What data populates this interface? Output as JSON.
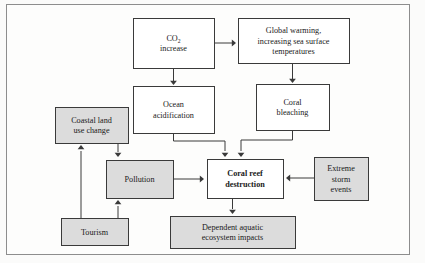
{
  "diagram": {
    "type": "flowchart",
    "frame": {
      "visible": true,
      "border_color": "#8d8d8d"
    },
    "colors": {
      "box_fill_white": "#ffffff",
      "box_fill_gray": "#dcdcdc",
      "box_stroke": "#3a3a3a",
      "text": "#1a1a1a",
      "arrow": "#3a3a3a"
    },
    "nodes": [
      {
        "id": "co2",
        "lines": [
          "CO",
          "increase"
        ],
        "subscript": "2",
        "style": "white",
        "bold": false,
        "x": 133,
        "y": 18,
        "w": 81,
        "h": 50
      },
      {
        "id": "global-warming",
        "lines": [
          "Global warming,",
          "increasing sea surface",
          "temperatures"
        ],
        "style": "white",
        "bold": false,
        "x": 238,
        "y": 18,
        "w": 111,
        "h": 45
      },
      {
        "id": "ocean-acidification",
        "lines": [
          "Ocean",
          "acidification"
        ],
        "style": "white",
        "bold": false,
        "x": 133,
        "y": 86,
        "w": 81,
        "h": 47
      },
      {
        "id": "coral-bleaching",
        "lines": [
          "Coral",
          "bleaching"
        ],
        "style": "white",
        "bold": false,
        "x": 256,
        "y": 84,
        "w": 73,
        "h": 46
      },
      {
        "id": "coastal-land-use",
        "lines": [
          "Coastal land",
          "use change"
        ],
        "style": "gray",
        "bold": false,
        "x": 55,
        "y": 107,
        "w": 73,
        "h": 36
      },
      {
        "id": "pollution",
        "lines": [
          "Pollution"
        ],
        "style": "gray",
        "bold": false,
        "x": 106,
        "y": 160,
        "w": 67,
        "h": 38
      },
      {
        "id": "coral-reef-destruction",
        "lines": [
          "Coral reef",
          "destruction"
        ],
        "style": "white",
        "bold": true,
        "x": 207,
        "y": 159,
        "w": 76,
        "h": 39
      },
      {
        "id": "extreme-storm-events",
        "lines": [
          "Extreme",
          "storm",
          "events"
        ],
        "style": "gray",
        "bold": false,
        "x": 314,
        "y": 157,
        "w": 54,
        "h": 43
      },
      {
        "id": "tourism",
        "lines": [
          "Tourism"
        ],
        "style": "gray",
        "bold": false,
        "x": 61,
        "y": 218,
        "w": 67,
        "h": 27
      },
      {
        "id": "dependent-aquatic",
        "lines": [
          "Dependent aquatic",
          "ecosystem impacts"
        ],
        "style": "gray",
        "bold": false,
        "x": 170,
        "y": 216,
        "w": 125,
        "h": 32
      }
    ],
    "edges": [
      {
        "id": "co2-to-global-warming",
        "from": "co2",
        "to": "global-warming",
        "path": "M214,43 L233,43",
        "arrow_at": [
          236,
          43
        ],
        "arrow_dir": "right"
      },
      {
        "id": "co2-to-ocean-acidification",
        "from": "co2",
        "to": "ocean-acidification",
        "path": "M173.5,68 L173.5,81",
        "arrow_at": [
          173.5,
          85
        ],
        "arrow_dir": "down"
      },
      {
        "id": "global-warming-to-coral-bleaching",
        "from": "global-warming",
        "to": "coral-bleaching",
        "path": "M292.5,63 L292.5,79",
        "arrow_at": [
          292.5,
          83
        ],
        "arrow_dir": "down"
      },
      {
        "id": "ocean-acidification-to-coral-reef",
        "from": "ocean-acidification",
        "to": "coral-reef-destruction",
        "path": "M173.5,133 L173.5,141 L225,141 L225,151",
        "arrow_at": [
          225,
          157
        ],
        "arrow_dir": "down"
      },
      {
        "id": "coral-bleaching-to-coral-reef",
        "from": "coral-bleaching",
        "to": "coral-reef-destruction",
        "path": "M292.5,130 L292.5,140 L241,140 L241,151",
        "arrow_at": [
          241,
          157
        ],
        "arrow_dir": "down"
      },
      {
        "id": "coastal-land-use-to-pollution",
        "from": "coastal-land-use",
        "to": "pollution",
        "path": "M118,143 L118,152",
        "arrow_at": [
          118,
          157
        ],
        "arrow_dir": "down"
      },
      {
        "id": "tourism-to-coastal-land-use",
        "from": "tourism",
        "to": "coastal-land-use",
        "path": "M81,218 L81,151",
        "arrow_at": [
          81,
          145
        ],
        "arrow_dir": "up"
      },
      {
        "id": "tourism-to-pollution",
        "from": "tourism",
        "to": "pollution",
        "path": "M118,218 L118,206",
        "arrow_at": [
          118,
          200
        ],
        "arrow_dir": "up"
      },
      {
        "id": "pollution-to-coral-reef",
        "from": "pollution",
        "to": "coral-reef-destruction",
        "path": "M173,179 L200,179",
        "arrow_at": [
          204,
          179
        ],
        "arrow_dir": "right"
      },
      {
        "id": "extreme-storm-to-coral-reef",
        "from": "extreme-storm-events",
        "to": "coral-reef-destruction",
        "path": "M314,178 L290,178",
        "arrow_at": [
          286,
          178
        ],
        "arrow_dir": "left"
      },
      {
        "id": "coral-reef-to-dependent-aquatic",
        "from": "coral-reef-destruction",
        "to": "dependent-aquatic",
        "path": "M232.5,198 L232.5,209",
        "arrow_at": [
          232.5,
          214
        ],
        "arrow_dir": "down"
      }
    ]
  }
}
